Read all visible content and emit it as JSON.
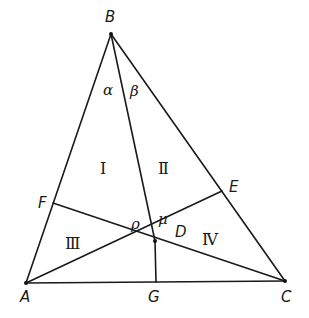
{
  "diagram": {
    "type": "triangle-cevians",
    "background": "#ffffff",
    "stroke_color": "#1a1a1a",
    "points": {
      "A": {
        "label": "A",
        "x": 26,
        "y": 283,
        "lx": 20,
        "ly": 302
      },
      "B": {
        "label": "B",
        "x": 111,
        "y": 34,
        "lx": 105,
        "ly": 22
      },
      "C": {
        "label": "C",
        "x": 285,
        "y": 281,
        "lx": 281,
        "ly": 302
      },
      "D": {
        "label": "D",
        "x": 155,
        "y": 241,
        "lx": 175,
        "ly": 237
      },
      "E": {
        "label": "E",
        "x": 222,
        "y": 191,
        "lx": 229,
        "ly": 192
      },
      "F": {
        "label": "F",
        "x": 53,
        "y": 203,
        "lx": 38,
        "ly": 208
      },
      "G": {
        "label": "G",
        "x": 156,
        "y": 282,
        "lx": 148,
        "ly": 302
      }
    },
    "segments": [
      {
        "from": "A",
        "to": "B"
      },
      {
        "from": "B",
        "to": "C"
      },
      {
        "from": "A",
        "to": "C"
      },
      {
        "from": "B",
        "to": "D"
      },
      {
        "from": "D",
        "to": "G"
      },
      {
        "from": "F",
        "to": "C"
      },
      {
        "from": "A",
        "to": "E"
      }
    ],
    "angle_labels": {
      "alpha": {
        "text": "α",
        "x": 103,
        "y": 95
      },
      "beta": {
        "text": "β",
        "x": 130,
        "y": 96
      },
      "rho": {
        "text": "ρ",
        "x": 131,
        "y": 229
      },
      "mu": {
        "text": "μ",
        "x": 158,
        "y": 224
      }
    },
    "region_labels": {
      "I": {
        "text": "Ⅰ",
        "x": 100,
        "y": 174
      },
      "II": {
        "text": "Ⅱ",
        "x": 158,
        "y": 174
      },
      "III": {
        "text": "Ⅲ",
        "x": 65,
        "y": 249
      },
      "IV": {
        "text": "Ⅳ",
        "x": 202,
        "y": 245
      }
    }
  }
}
